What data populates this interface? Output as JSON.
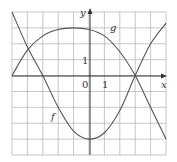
{
  "chart_data": {
    "type": "line",
    "title": "",
    "xlabel": "x",
    "ylabel": "y",
    "xlim": [
      -5,
      5
    ],
    "ylim": [
      -5,
      4
    ],
    "grid": true,
    "tick_labels": {
      "origin": "0",
      "x_one": "1",
      "y_one": "1"
    },
    "series": [
      {
        "name": "f",
        "x": [
          -5,
          -4,
          -3,
          -2,
          -1,
          0,
          1,
          2,
          3,
          4,
          5
        ],
        "y": [
          4,
          1.8,
          0,
          -2,
          -3.5,
          -4,
          -3.6,
          -2.2,
          0,
          2,
          3.3
        ]
      },
      {
        "name": "g",
        "x": [
          -5,
          -4,
          -3,
          -2,
          -1,
          0,
          1,
          2,
          3,
          4,
          5
        ],
        "y": [
          0,
          1.6,
          2.5,
          2.9,
          3,
          2.9,
          2.5,
          1.5,
          0,
          -2,
          -4
        ]
      }
    ],
    "annotations": [
      {
        "text": "f",
        "x": -2.5,
        "y": -3.2
      },
      {
        "text": "g",
        "x": 1.6,
        "y": 2.4
      }
    ]
  }
}
